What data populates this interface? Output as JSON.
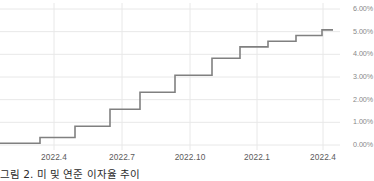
{
  "caption": {
    "text": "그림 2. 미 및 연준 이자율 추이"
  },
  "colors": {
    "line": "#808080",
    "grid": "#e8e8e8",
    "axis_text": "#888888",
    "xaxis_text": "#5a5a5a",
    "background": "#ffffff"
  },
  "chart_data": {
    "type": "line",
    "title": "",
    "subtitle": "",
    "xlabel": "",
    "ylabel": "",
    "grid": true,
    "legend": "none",
    "line_style": "step-after",
    "ylim": [
      0.0,
      6.0
    ],
    "y_ticks": [
      0.0,
      1.0,
      2.0,
      3.0,
      4.0,
      5.0,
      6.0
    ],
    "y_tick_labels": [
      "0.00%",
      "1.00%",
      "2.00%",
      "3.00%",
      "4.00%",
      "5.00%",
      "6.00%"
    ],
    "x_tick_labels": [
      "2022.4",
      "2022.7",
      "2022.10",
      "2022.1",
      "2022.4"
    ],
    "x_tick_positions": [
      54,
      122,
      190,
      257,
      323
    ],
    "series": [
      {
        "name": "Policy Rate",
        "unit": "%",
        "values": [
          0.08,
          0.33,
          0.83,
          1.58,
          2.33,
          3.08,
          3.83,
          4.33,
          4.58,
          4.83,
          5.08
        ],
        "step_x": [
          0,
          40,
          75,
          110,
          140,
          175,
          212,
          240,
          268,
          296,
          322
        ],
        "step_end_x": 333,
        "labels": [
          "0.08%",
          "0.33%",
          "0.83%",
          "1.58%",
          "2.33%",
          "3.08%",
          "3.83%",
          "4.33%",
          "4.58%",
          "4.83%",
          "5.08%"
        ]
      }
    ]
  }
}
